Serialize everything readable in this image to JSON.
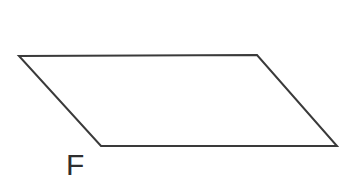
{
  "figure": {
    "shape": "parallelogram",
    "label": "F",
    "points": "19,56 257,55 337,146 101,146",
    "stroke_color": "#3a3a3a",
    "stroke_width": "2",
    "fill_color": "none",
    "background_color": "#ffffff"
  }
}
